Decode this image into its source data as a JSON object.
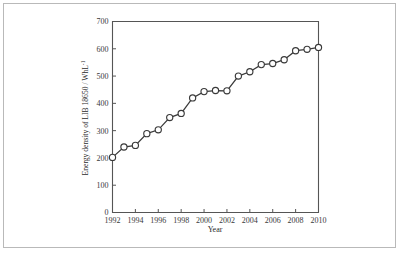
{
  "figure": {
    "background_color": "#ffffff",
    "border_color": "#b9b9b9",
    "line_color": "#3a3a3a",
    "marker_fill": "#ffffff",
    "axis_color": "#555555"
  },
  "chart_data": {
    "type": "line",
    "title": "",
    "xlabel": "Year",
    "ylabel_main": "Energy density of LIB 18650 / WhL",
    "ylabel_exponent": "-1",
    "ylabel_full": "Energy density of LIB 18650 / WhL⁻¹",
    "xlim": [
      1992,
      2010
    ],
    "ylim": [
      0,
      700
    ],
    "xticks": [
      1992,
      1994,
      1996,
      1998,
      2000,
      2002,
      2004,
      2006,
      2008,
      2010
    ],
    "xtick_labels": [
      "1992",
      "1994",
      "1996",
      "1998",
      "2000",
      "2002",
      "2004",
      "2006",
      "2008",
      "2010"
    ],
    "yticks": [
      0,
      100,
      200,
      300,
      400,
      500,
      600,
      700
    ],
    "ytick_labels": [
      "0",
      "100",
      "200",
      "300",
      "400",
      "500",
      "600",
      "700"
    ],
    "grid": false,
    "legend": null,
    "marker": "open-circle",
    "x": [
      1992,
      1993,
      1994,
      1995,
      1996,
      1997,
      1998,
      1999,
      2000,
      2001,
      2002,
      2003,
      2004,
      2005,
      2006,
      2007,
      2008,
      2009,
      2010
    ],
    "values": [
      202,
      240,
      246,
      289,
      303,
      348,
      363,
      420,
      443,
      447,
      446,
      500,
      516,
      542,
      546,
      560,
      593,
      598,
      605
    ],
    "series": [
      {
        "name": "Energy density of LIB 18650",
        "values": [
          202,
          240,
          246,
          289,
          303,
          348,
          363,
          420,
          443,
          447,
          446,
          500,
          516,
          542,
          546,
          560,
          593,
          598,
          605
        ]
      }
    ]
  }
}
